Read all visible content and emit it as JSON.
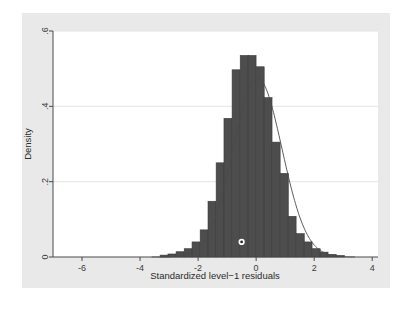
{
  "figure": {
    "background_color": "#ffffff",
    "panel_color": "#e9e9e9",
    "plot_background_color": "#ffffff",
    "bar_color": "#4d4d4d",
    "bar_edge_color": "#3a3a3a",
    "curve_color": "#4a4a4a",
    "grid_color": "#e4e4e4",
    "axis_color": "#4a4a4a"
  },
  "axis_labels": {
    "x_title": "Standardized level−1 residuals",
    "y_title": "Density"
  },
  "x_ticks": [
    "-6",
    "-4",
    "-2",
    "0",
    "2",
    "4"
  ],
  "y_ticks": [
    "0",
    ".2",
    ".4",
    ".6"
  ],
  "chart_data": {
    "type": "bar",
    "title": "",
    "subtitle": "",
    "xlabel": "Standardized level−1 residuals",
    "ylabel": "Density",
    "xlim": [
      -7,
      4.2
    ],
    "ylim": [
      0,
      0.6
    ],
    "xticks": [
      -6,
      -4,
      -2,
      0,
      2,
      4
    ],
    "yticks": [
      0,
      0.2,
      0.4,
      0.6
    ],
    "xtick_labels": [
      "-6",
      "-4",
      "-2",
      "0",
      "2",
      "4"
    ],
    "ytick_labels": [
      "0",
      ".2",
      ".4",
      ".6"
    ],
    "grid": "horizontal",
    "legend": "none",
    "bin_width": 0.276,
    "series": [
      {
        "name": "histogram",
        "kind": "bar",
        "color": "#4d4d4d",
        "bin_centers": [
          -3.17,
          -2.9,
          -2.62,
          -2.34,
          -2.07,
          -1.79,
          -1.52,
          -1.24,
          -0.97,
          -0.69,
          -0.41,
          -0.14,
          0.14,
          0.41,
          0.69,
          0.97,
          1.24,
          1.52,
          1.79,
          2.07,
          2.34,
          2.62,
          2.9
        ],
        "values": [
          0.005,
          0.008,
          0.014,
          0.022,
          0.04,
          0.072,
          0.148,
          0.25,
          0.368,
          0.497,
          0.535,
          0.535,
          0.505,
          0.423,
          0.305,
          0.222,
          0.108,
          0.062,
          0.04,
          0.022,
          0.013,
          0.007,
          0.004
        ]
      },
      {
        "name": "normal-density",
        "kind": "line",
        "color": "#4a4a4a",
        "mean": 0.05,
        "sd": 0.84,
        "peak": 0.475
      },
      {
        "name": "marker",
        "kind": "scatter",
        "x": [
          -0.5
        ],
        "y": [
          0.04
        ],
        "marker": "circle-dot",
        "face_color": "#ffffff",
        "edge_color": "#2a2a2a"
      }
    ]
  }
}
